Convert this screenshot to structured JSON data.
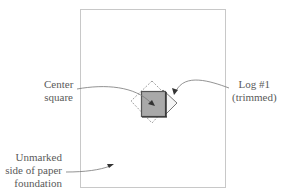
{
  "figure": {
    "labels": {
      "center": {
        "line1": "Center",
        "line2": "square"
      },
      "log": {
        "line1": "Log #1",
        "line2": "(trimmed)"
      },
      "unmarked": {
        "line1": "Unmarked",
        "line2": "side of paper",
        "line3": "foundation"
      }
    },
    "colors": {
      "frame": "#c8c8c8",
      "center_fill": "#a9a9a9",
      "center_stroke": "#555555",
      "leader": "#777777"
    }
  }
}
